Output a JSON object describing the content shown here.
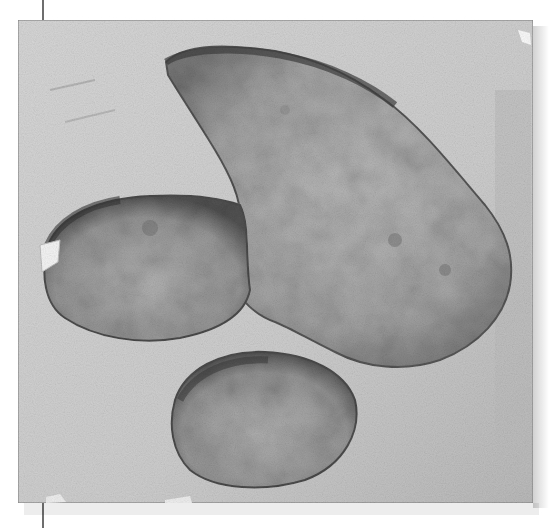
{
  "image": {
    "subject": "fossil three-toed footprint on stone slab",
    "style": "grayscale photograph",
    "slab": {
      "x": 18,
      "y": 20,
      "width": 515,
      "height": 483
    },
    "colors": {
      "background": "#ffffff",
      "slab": "#cfcfcf",
      "slab_edge": "#8a8a8a",
      "track_fill": "#a9a9a9",
      "track_shadow": "#4a4a4a",
      "rule": "#6e6e6e"
    },
    "regions": [
      {
        "name": "upper-toe",
        "description": "digit extending up and left to about (165,60)"
      },
      {
        "name": "left-toe",
        "description": "rounded digit on left side near (45,280)"
      },
      {
        "name": "lower-toe",
        "description": "oval digit at bottom near (250,420)"
      },
      {
        "name": "heel-pad",
        "description": "broad central and right region reaching (510,270)"
      }
    ]
  }
}
